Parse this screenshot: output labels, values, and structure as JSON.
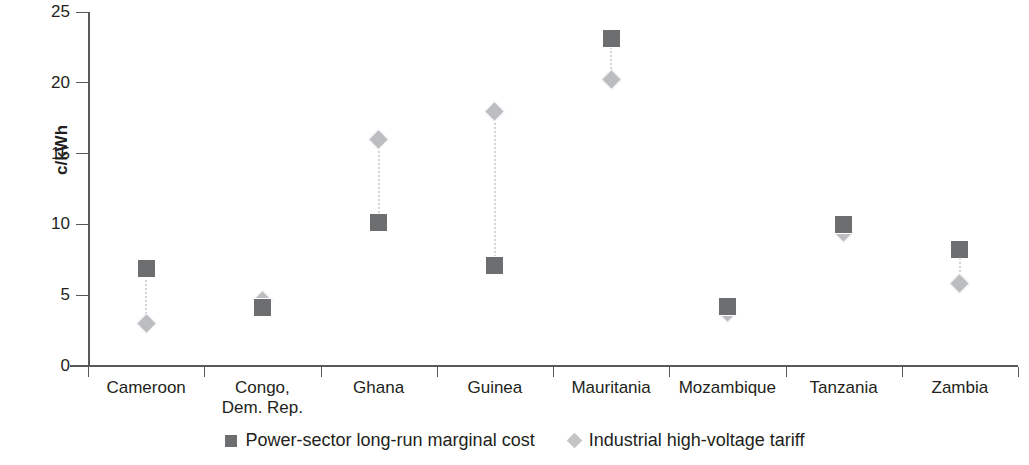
{
  "chart_data": {
    "type": "scatter",
    "title": "",
    "xlabel": "",
    "ylabel": "c/kWh",
    "ylim": [
      0,
      25
    ],
    "yticks": [
      0,
      5,
      10,
      15,
      20,
      25
    ],
    "grid": false,
    "legend_position": "bottom-center",
    "categories": [
      "Cameroon",
      "Congo, Dem. Rep.",
      "Ghana",
      "Guinea",
      "Mauritania",
      "Mozambique",
      "Tanzania",
      "Zambia"
    ],
    "category_lines": [
      [
        "Cameroon"
      ],
      [
        "Congo,",
        "Dem. Rep."
      ],
      [
        "Ghana"
      ],
      [
        "Guinea"
      ],
      [
        "Mauritania"
      ],
      [
        "Mozambique"
      ],
      [
        "Tanzania"
      ],
      [
        "Zambia"
      ]
    ],
    "series": [
      {
        "name": "Power-sector long-run marginal cost",
        "marker": "square",
        "color": "#6d6e70",
        "values": [
          6.9,
          4.1,
          10.1,
          7.1,
          23.1,
          4.2,
          10.0,
          8.2
        ]
      },
      {
        "name": "Industrial high-voltage tariff",
        "marker": "diamond",
        "color": "#bcbdc0",
        "values": [
          3.0,
          4.6,
          16.0,
          18.0,
          20.2,
          3.8,
          9.4,
          5.8
        ]
      }
    ]
  },
  "axis": {
    "y_tick_labels": [
      "0",
      "5",
      "10",
      "15",
      "20",
      "25"
    ],
    "y_title": "c/kWh"
  },
  "legend": {
    "items": [
      {
        "label": "Power-sector long-run marginal cost",
        "marker": "square-marker-icon"
      },
      {
        "label": "Industrial high-voltage tariff",
        "marker": "diamond-marker-icon"
      }
    ]
  },
  "colors": {
    "series_cost": "#6d6e70",
    "series_tariff": "#bcbdc0",
    "axis": "#58595b",
    "text": "#231f20",
    "connector": "#d4d4d4",
    "background": "#ffffff"
  }
}
